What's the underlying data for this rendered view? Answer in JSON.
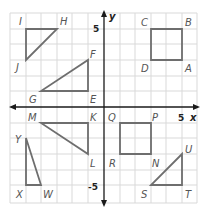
{
  "diagram": {
    "type": "coordinate-plane",
    "axes": {
      "x_label": "x",
      "y_label": "y",
      "x_range": [
        -6,
        6
      ],
      "y_range": [
        -6,
        6
      ],
      "tick_labels": {
        "x_pos": "5",
        "y_pos": "5",
        "y_neg": "-5"
      }
    },
    "colors": {
      "grid": "#d9d9d9",
      "axis": "#1a1a1a",
      "shape": "#6e6e6e",
      "label": "#555555"
    },
    "shapes": [
      {
        "name": "triangle-IHJ",
        "vertices": [
          {
            "label": "I",
            "x": -5,
            "y": 4
          },
          {
            "label": "H",
            "x": -3,
            "y": 4
          },
          {
            "label": "J",
            "x": -5,
            "y": 2
          }
        ]
      },
      {
        "name": "triangle-GEF",
        "vertices": [
          {
            "label": "G",
            "x": -4,
            "y": 1
          },
          {
            "label": "E",
            "x": -1,
            "y": 1
          },
          {
            "label": "F",
            "x": -1,
            "y": 3
          }
        ]
      },
      {
        "name": "square-CBAD",
        "vertices": [
          {
            "label": "C",
            "x": 3,
            "y": 4
          },
          {
            "label": "B",
            "x": 5,
            "y": 4
          },
          {
            "label": "A",
            "x": 5,
            "y": 2
          },
          {
            "label": "D",
            "x": 3,
            "y": 2
          }
        ]
      },
      {
        "name": "triangle-MKL",
        "vertices": [
          {
            "label": "M",
            "x": -4,
            "y": -1
          },
          {
            "label": "K",
            "x": -1,
            "y": -1
          },
          {
            "label": "L",
            "x": -1,
            "y": -3
          }
        ]
      },
      {
        "name": "square-QPNR",
        "vertices": [
          {
            "label": "Q",
            "x": 1,
            "y": -1
          },
          {
            "label": "P",
            "x": 3,
            "y": -1
          },
          {
            "label": "N",
            "x": 3,
            "y": -3
          },
          {
            "label": "R",
            "x": 1,
            "y": -3
          }
        ]
      },
      {
        "name": "triangle-YXW",
        "vertices": [
          {
            "label": "Y",
            "x": -5,
            "y": -2
          },
          {
            "label": "X",
            "x": -5,
            "y": -5
          },
          {
            "label": "W",
            "x": -4,
            "y": -5
          }
        ]
      },
      {
        "name": "triangle-UST",
        "vertices": [
          {
            "label": "U",
            "x": 5,
            "y": -3
          },
          {
            "label": "S",
            "x": 3,
            "y": -5
          },
          {
            "label": "T",
            "x": 5,
            "y": -5
          }
        ]
      }
    ],
    "labels": {
      "I": "I",
      "H": "H",
      "J": "J",
      "G": "G",
      "E": "E",
      "F": "F",
      "C": "C",
      "B": "B",
      "A": "A",
      "D": "D",
      "M": "M",
      "K": "K",
      "L": "L",
      "Q": "Q",
      "P": "P",
      "N": "N",
      "R": "R",
      "Y": "Y",
      "X": "X",
      "W": "W",
      "U": "U",
      "S": "S",
      "T": "T"
    }
  }
}
